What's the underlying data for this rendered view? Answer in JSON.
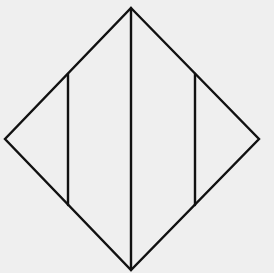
{
  "diagram": {
    "type": "geometric-figure",
    "background_color": "#efefef",
    "stroke_color": "#111111",
    "vertices": {
      "top": [
        131,
        8
      ],
      "right": [
        259,
        139
      ],
      "bottom": [
        131,
        270
      ],
      "left": [
        5,
        139
      ]
    },
    "vertical_segments": [
      {
        "name": "left-inner",
        "x": 68,
        "y1": 74,
        "y2": 205
      },
      {
        "name": "center",
        "x": 131,
        "y1": 8,
        "y2": 270
      },
      {
        "name": "right-inner",
        "x": 195,
        "y1": 74,
        "y2": 205
      }
    ]
  }
}
